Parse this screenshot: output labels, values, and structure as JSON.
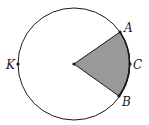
{
  "diagram": {
    "type": "circle-sector",
    "circle": {
      "cx": 74,
      "cy": 64,
      "r": 56,
      "stroke": "#1a1a1a",
      "fill": "#ffffff"
    },
    "center": {
      "x": 74,
      "y": 64
    },
    "sector": {
      "fill": "#999999",
      "from": "A",
      "to": "B",
      "through": "C"
    },
    "points": [
      {
        "name": "A",
        "label": "A",
        "x": 120,
        "y": 32,
        "lx": 125,
        "ly": 32
      },
      {
        "name": "C",
        "label": "C",
        "x": 130,
        "y": 64,
        "lx": 134,
        "ly": 69
      },
      {
        "name": "B",
        "label": "B",
        "x": 119,
        "y": 96,
        "lx": 123,
        "ly": 106
      },
      {
        "name": "K",
        "label": "K",
        "x": 18,
        "y": 64,
        "lx": 6,
        "ly": 69
      }
    ]
  }
}
